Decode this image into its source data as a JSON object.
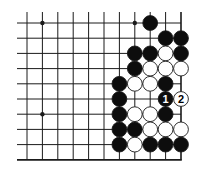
{
  "diagram": {
    "type": "go-board-fragment",
    "colors": {
      "background": "#ffffff",
      "line": "#1a1a1a",
      "black_stone": "#0d0d0d",
      "white_stone": "#ffffff",
      "stone_outline": "#1a1a1a"
    },
    "grid": {
      "columns": 11,
      "rows": 10,
      "origin_x": 27,
      "origin_y": 23,
      "spacing_x": 15.4,
      "spacing_y": 15.2,
      "stone_radius": 7.4,
      "edges": [
        "right",
        "bottom"
      ]
    },
    "star_points": [
      {
        "col": 1,
        "row": 0
      },
      {
        "col": 7,
        "row": 0
      },
      {
        "col": 1,
        "row": 6
      }
    ],
    "stones": [
      {
        "col": 8,
        "row": 0,
        "color": "black"
      },
      {
        "col": 9,
        "row": 1,
        "color": "black"
      },
      {
        "col": 10,
        "row": 1,
        "color": "black"
      },
      {
        "col": 7,
        "row": 2,
        "color": "black"
      },
      {
        "col": 8,
        "row": 2,
        "color": "black"
      },
      {
        "col": 9,
        "row": 2,
        "color": "white"
      },
      {
        "col": 10,
        "row": 2,
        "color": "black"
      },
      {
        "col": 7,
        "row": 3,
        "color": "black"
      },
      {
        "col": 8,
        "row": 3,
        "color": "white"
      },
      {
        "col": 9,
        "row": 3,
        "color": "white"
      },
      {
        "col": 10,
        "row": 3,
        "color": "white"
      },
      {
        "col": 6,
        "row": 4,
        "color": "black"
      },
      {
        "col": 7,
        "row": 4,
        "color": "white"
      },
      {
        "col": 8,
        "row": 4,
        "color": "white"
      },
      {
        "col": 9,
        "row": 4,
        "color": "black"
      },
      {
        "col": 6,
        "row": 5,
        "color": "black"
      },
      {
        "col": 9,
        "row": 5,
        "color": "black",
        "label": "1"
      },
      {
        "col": 10,
        "row": 5,
        "color": "white",
        "label": "2"
      },
      {
        "col": 6,
        "row": 6,
        "color": "black"
      },
      {
        "col": 7,
        "row": 6,
        "color": "white"
      },
      {
        "col": 8,
        "row": 6,
        "color": "white"
      },
      {
        "col": 9,
        "row": 6,
        "color": "black"
      },
      {
        "col": 6,
        "row": 7,
        "color": "black"
      },
      {
        "col": 7,
        "row": 7,
        "color": "black"
      },
      {
        "col": 8,
        "row": 7,
        "color": "white"
      },
      {
        "col": 9,
        "row": 7,
        "color": "white"
      },
      {
        "col": 10,
        "row": 7,
        "color": "white"
      },
      {
        "col": 6,
        "row": 8,
        "color": "black"
      },
      {
        "col": 7,
        "row": 8,
        "color": "white"
      },
      {
        "col": 8,
        "row": 8,
        "color": "black"
      },
      {
        "col": 9,
        "row": 8,
        "color": "black"
      },
      {
        "col": 10,
        "row": 8,
        "color": "black"
      }
    ],
    "move_labels": [
      "1",
      "2"
    ]
  }
}
